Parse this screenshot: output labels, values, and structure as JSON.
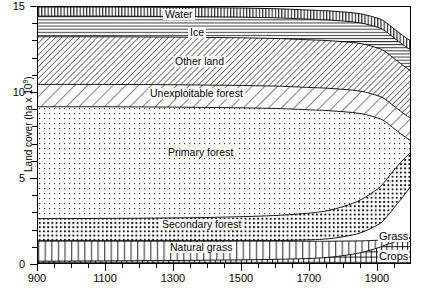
{
  "chart_data": {
    "type": "area",
    "title": "",
    "xlabel": "",
    "ylabel": "Land cover (ha x 10⁹)",
    "ylabel_base": "Land cover (ha x 10",
    "ylabel_exp": "9",
    "ylabel_close": ")",
    "xlim": [
      900,
      2000
    ],
    "ylim": [
      0,
      15
    ],
    "x_ticks": [
      "900",
      "1100",
      "1300",
      "1500",
      "1700",
      "1900"
    ],
    "x_tick_values": [
      900,
      1100,
      1300,
      1500,
      1700,
      1900
    ],
    "x_minor_step": 50,
    "y_ticks": [
      "0",
      "5",
      "10",
      "15"
    ],
    "y_tick_values": [
      0,
      5,
      10,
      15
    ],
    "y_minor_step": 1,
    "grid": false,
    "legend_position": "in-plot annotations",
    "stacking": "bottom-to-top",
    "x": [
      900,
      1000,
      1100,
      1200,
      1300,
      1400,
      1500,
      1600,
      1700,
      1750,
      1800,
      1850,
      1900,
      1920,
      1950,
      1980,
      2000
    ],
    "series": [
      {
        "name": "Crops",
        "label": "Crops",
        "pattern": "crosshatch",
        "label_position": "right-outside",
        "values": [
          0.22,
          0.23,
          0.24,
          0.25,
          0.26,
          0.28,
          0.3,
          0.33,
          0.38,
          0.44,
          0.55,
          0.72,
          1.0,
          1.15,
          1.35,
          1.5,
          1.58
        ]
      },
      {
        "name": "Natural grass",
        "label": "Natural grass",
        "pattern": "vertical-lines",
        "label_position": "in-band",
        "values": [
          1.18,
          1.17,
          1.16,
          1.15,
          1.14,
          1.12,
          1.1,
          1.06,
          1.0,
          0.94,
          0.84,
          0.68,
          0.44,
          0.32,
          0.14,
          0.04,
          0.0
        ]
      },
      {
        "name": "Grass",
        "label": "Grass",
        "pattern": "blank",
        "label_position": "right-outside",
        "values": [
          0.0,
          0.0,
          0.0,
          0.0,
          0.0,
          0.0,
          0.01,
          0.03,
          0.08,
          0.14,
          0.26,
          0.48,
          0.9,
          1.2,
          1.9,
          2.6,
          3.1
        ]
      },
      {
        "name": "Secondary forest",
        "label": "Secondary forest",
        "pattern": "coarse-dots",
        "label_position": "in-band",
        "values": [
          1.3,
          1.3,
          1.31,
          1.32,
          1.34,
          1.36,
          1.4,
          1.46,
          1.56,
          1.64,
          1.76,
          1.92,
          2.1,
          2.18,
          2.2,
          2.1,
          1.95
        ]
      },
      {
        "name": "Primary forest",
        "label": "Primary forest",
        "pattern": "fine-dots",
        "label_position": "in-band",
        "values": [
          6.5,
          6.5,
          6.49,
          6.47,
          6.44,
          6.4,
          6.33,
          6.22,
          6.0,
          5.82,
          5.5,
          5.0,
          4.1,
          3.5,
          2.3,
          1.2,
          0.55
        ]
      },
      {
        "name": "Unexploitable forest",
        "label": "Unexploitable forest",
        "pattern": "coarse-diagonal",
        "label_position": "in-band",
        "values": [
          1.3,
          1.3,
          1.3,
          1.3,
          1.3,
          1.3,
          1.3,
          1.3,
          1.3,
          1.3,
          1.3,
          1.3,
          1.3,
          1.3,
          1.3,
          1.3,
          1.3
        ]
      },
      {
        "name": "Other land",
        "label": "Other land",
        "pattern": "fine-diagonal",
        "label_position": "in-band",
        "values": [
          2.77,
          2.77,
          2.77,
          2.77,
          2.77,
          2.77,
          2.77,
          2.77,
          2.77,
          2.77,
          2.77,
          2.77,
          2.77,
          2.77,
          2.77,
          2.77,
          2.77
        ]
      },
      {
        "name": "Ice",
        "label": "Ice",
        "pattern": "horizontal-lines",
        "label_position": "in-band",
        "values": [
          1.2,
          1.2,
          1.2,
          1.2,
          1.2,
          1.2,
          1.2,
          1.2,
          1.2,
          1.2,
          1.2,
          1.2,
          1.2,
          1.2,
          1.2,
          1.2,
          1.2
        ]
      },
      {
        "name": "Water",
        "label": "Water",
        "pattern": "vertical-hatch",
        "label_position": "in-band",
        "values": [
          0.53,
          0.53,
          0.53,
          0.53,
          0.53,
          0.53,
          0.53,
          0.53,
          0.53,
          0.53,
          0.53,
          0.53,
          0.53,
          0.53,
          0.53,
          0.53,
          0.53
        ]
      }
    ],
    "annotations": [
      {
        "text": "Water",
        "x": 1390,
        "y": 14.7
      },
      {
        "text": "Ice",
        "x": 1390,
        "y": 13.6
      },
      {
        "text": "Other land",
        "x": 1390,
        "y": 11.8
      },
      {
        "text": "Unexploitable forest",
        "x": 1390,
        "y": 9.85
      },
      {
        "text": "Primary forest",
        "x": 1380,
        "y": 6.4
      },
      {
        "text": "Secondary forest",
        "x": 1390,
        "y": 2.05
      },
      {
        "text": "Natural grass",
        "x": 1380,
        "y": 0.85
      },
      {
        "text": "Grass",
        "x": 1975,
        "y": 1.7
      },
      {
        "text": "Crops",
        "x": 1975,
        "y": 0.52
      }
    ]
  },
  "colors": {
    "ink": "#000000",
    "background": "#ffffff",
    "pattern_stroke": "#2a2a2a"
  }
}
